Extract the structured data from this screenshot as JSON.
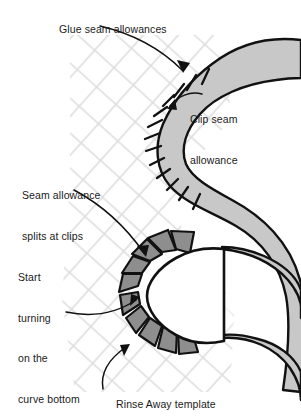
{
  "figure": {
    "colors": {
      "band_fill": "#c8c8c8",
      "tab_fill": "#8e8e8e",
      "outline": "#111111",
      "grid": "#d8d8d8",
      "text": "#1a1a1a",
      "background": "#ffffff",
      "template_white": "#ffffff"
    }
  },
  "labels": {
    "glue": "Glue seam allowances",
    "clip_line1": "Clip seam",
    "clip_line2": "allowance",
    "seam_line1": "Seam allowance",
    "seam_line2": "splits at clips",
    "start_line1": "Start",
    "start_line2": "turning",
    "start_line3": "on the",
    "start_line4": "curve bottom",
    "rinse": "Rinse Away template"
  },
  "annotations": [
    {
      "name": "glue-seam-allowances",
      "target": "upper-convex-band-edge"
    },
    {
      "name": "clip-seam-allowance",
      "target": "inner-concave-clip-region"
    },
    {
      "name": "seam-allowance-splits-at-clips",
      "target": "splayed-tabs"
    },
    {
      "name": "start-turning-on-the-curve-bottom",
      "target": "template-curve-bottom"
    },
    {
      "name": "rinse-away-template",
      "target": "template-disc"
    }
  ],
  "elements": {
    "band": "serpentine-s-curve-band",
    "clip_marks_count": 13,
    "tabs_count": 10,
    "grid": "diagonal-crosshatch"
  }
}
